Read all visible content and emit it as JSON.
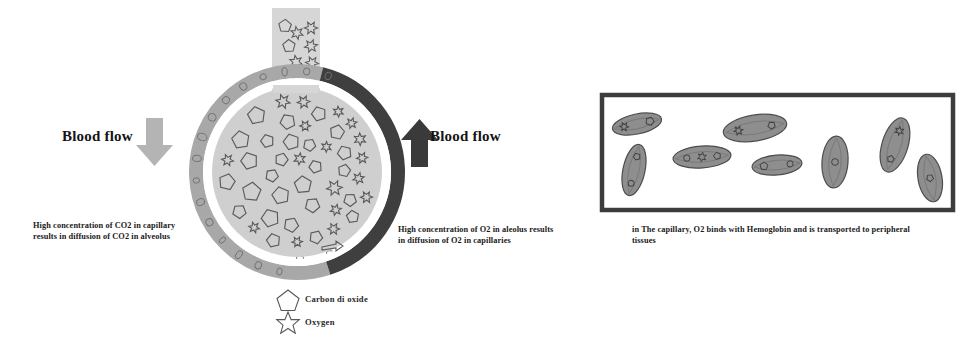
{
  "diagram": {
    "colors": {
      "capillary_wall_light": "#a8a8a8",
      "capillary_wall_dark": "#3f3f3f",
      "alveolus_fill": "#cfcfcf",
      "tube_fill": "#d6d6d6",
      "particle_stroke": "#595959",
      "arrow_light": "#b4b4b4",
      "arrow_dark": "#3a3a3a",
      "rbc_fill": "#8e8e8e",
      "rbc_stroke": "#4d4d4d",
      "box_border": "#3c3c3c",
      "text": "#141414",
      "background": "#ffffff"
    }
  },
  "left_panel": {
    "blood_flow_label": "Blood flow",
    "arrow_direction": "down",
    "caption": "High concentration of CO2 in capillary results in diffusion of CO2 in alveolus"
  },
  "right_panel": {
    "blood_flow_label": "Blood flow",
    "arrow_direction": "up",
    "caption": "High concentration of O2 in aleolus results in diffusion of O2 in capillaries"
  },
  "legend": {
    "items": [
      {
        "shape": "pentagon",
        "label": "Carbon di oxide"
      },
      {
        "shape": "star",
        "label": "Oxygen"
      }
    ]
  },
  "capillary_panel": {
    "caption": "in The capillary, O2 binds with Hemoglobin and is transported to peripheral tissues",
    "box": {
      "x": 600,
      "y": 93,
      "width": 355,
      "height": 119
    },
    "red_blood_cells": [
      {
        "cx": 637,
        "cy": 124,
        "rx": 25,
        "ry": 10,
        "rotation": -12,
        "cargo": 2
      },
      {
        "cx": 634,
        "cy": 170,
        "rx": 11,
        "ry": 26,
        "rotation": 12,
        "cargo": 2
      },
      {
        "cx": 702,
        "cy": 157,
        "rx": 29,
        "ry": 11,
        "rotation": -4,
        "cargo": 3
      },
      {
        "cx": 755,
        "cy": 128,
        "rx": 32,
        "ry": 13,
        "rotation": -9,
        "cargo": 2
      },
      {
        "cx": 777,
        "cy": 165,
        "rx": 25,
        "ry": 10,
        "rotation": -5,
        "cargo": 2
      },
      {
        "cx": 835,
        "cy": 162,
        "rx": 13,
        "ry": 26,
        "rotation": 4,
        "cargo": 1
      },
      {
        "cx": 895,
        "cy": 145,
        "rx": 13,
        "ry": 28,
        "rotation": 17,
        "cargo": 2
      },
      {
        "cx": 930,
        "cy": 178,
        "rx": 12,
        "ry": 24,
        "rotation": -10,
        "cargo": 1
      }
    ]
  },
  "alveolus": {
    "center_x": 297,
    "center_y": 172,
    "outer_radius": 108,
    "wall_thickness": 14,
    "inner_radius": 85,
    "tube": {
      "x": 272,
      "y": 8,
      "width": 48,
      "height": 100
    },
    "co2_count": 26,
    "o2_count": 42,
    "wall_cell_count": 16
  }
}
